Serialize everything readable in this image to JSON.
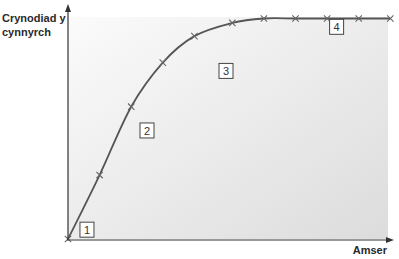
{
  "chart_data": {
    "type": "line",
    "title": "",
    "xlabel": "Amser",
    "ylabel": "Crynodiad y cynnyrch",
    "ylabel_lines": [
      "Crynodiad y",
      "cynnyrch"
    ],
    "x": [
      0,
      1,
      2,
      3,
      4,
      5.2,
      6.2,
      7.2,
      8.2,
      9.2,
      10.2
    ],
    "series": [
      {
        "name": "product concentration",
        "values": [
          0,
          29,
          60,
          80,
          92,
          98,
          100,
          100,
          100,
          100,
          100
        ],
        "markers": "x"
      }
    ],
    "xlim": [
      0,
      10.3
    ],
    "ylim": [
      0,
      100
    ],
    "grid": false,
    "ticks": false,
    "annotations": [
      {
        "label": "1",
        "x": 0.6,
        "y": 4
      },
      {
        "label": "2",
        "x": 2.5,
        "y": 49
      },
      {
        "label": "3",
        "x": 5.0,
        "y": 76
      },
      {
        "label": "4",
        "x": 8.5,
        "y": 96
      }
    ],
    "background": {
      "from": "#fbfbfb",
      "to": "#dcdcdc"
    },
    "line_color": "#555555",
    "axis_color": "#333333"
  }
}
